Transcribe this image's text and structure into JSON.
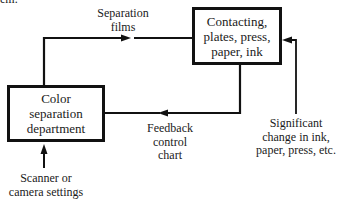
{
  "diagram": {
    "top_fragment": "em.",
    "nodes": {
      "color_separation": {
        "lines": [
          "Color",
          "separation",
          "department"
        ]
      },
      "contacting": {
        "lines": [
          "Contacting,",
          "plates, press,",
          "paper, ink"
        ]
      }
    },
    "edge_labels": {
      "separation_films": [
        "Separation",
        "films"
      ],
      "feedback_chart": [
        "Feedback",
        "control",
        "chart"
      ],
      "significant_change": [
        "Significant",
        "change in ink,",
        "paper, press, etc."
      ],
      "scanner_settings": [
        "Scanner or",
        "camera settings"
      ]
    },
    "edges": [
      {
        "from": "color_separation",
        "to": "contacting",
        "label": "separation_films"
      },
      {
        "from": "contacting",
        "to": "color_separation",
        "label": "feedback_chart"
      },
      {
        "from": "significant_change",
        "to": "contacting"
      },
      {
        "from": "scanner_settings",
        "to": "color_separation"
      }
    ],
    "colors": {
      "stroke": "#111111",
      "text": "#1a1a1a",
      "background": "#ffffff"
    }
  }
}
